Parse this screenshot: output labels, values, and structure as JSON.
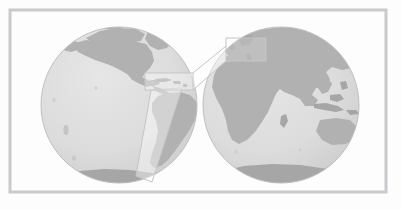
{
  "figure": {
    "background_color": "#fdfdfd",
    "frame": {
      "name": "outer-frame",
      "x": 10,
      "y": 10,
      "width": 376,
      "height": 182,
      "stroke_color": "#c9c9ce",
      "stroke_width": 3,
      "fill": "none"
    },
    "palette": {
      "ocean": "#dedede",
      "ocean_shade": "#d4d4d4",
      "land": "#b1b1b1",
      "land_dark": "#a6a6a6",
      "globe_outline": "#bfbfbf",
      "callout_stroke": "#c6c6c6",
      "callout_fill": "#ffffff",
      "connector_stroke": "#c6c6c6",
      "background": "#fdfdfd"
    },
    "globes": [
      {
        "name": "globe-americas",
        "label": "Western hemisphere globe showing the Americas",
        "center_x": 119,
        "center_y": 105,
        "radius": 78,
        "regions": [
          "North America",
          "Central America",
          "South America",
          "Greenland",
          "Antarctica"
        ]
      },
      {
        "name": "globe-eurasia-africa",
        "label": "Eastern hemisphere globe showing Europe, Africa, Asia and Australia",
        "center_x": 281,
        "center_y": 105,
        "radius": 78,
        "regions": [
          "Europe",
          "Africa",
          "Asia",
          "Australia",
          "Indonesia",
          "Antarctica"
        ]
      }
    ],
    "callouts": [
      {
        "name": "callout-rect-americas",
        "label": "Zoom rectangle over Central America and the Caribbean",
        "x": 145,
        "y": 73,
        "width": 48,
        "height": 17
      },
      {
        "name": "callout-rect-europe",
        "label": "Zoom rectangle over Europe",
        "x": 226,
        "y": 38,
        "width": 40,
        "height": 23
      }
    ],
    "connectors": [
      {
        "name": "connector-upper",
        "label": "Upper connector line from Americas callout to Europe callout",
        "points": "193,73 226,46"
      },
      {
        "name": "connector-lower",
        "label": "Lower connector line from Americas callout to Europe callout",
        "points": "193,90 226,61"
      }
    ],
    "pointer": {
      "name": "pointer-quadrilateral",
      "label": "Narrow tapering quadrilateral pointing to the south-west",
      "points": "151,90 182,88 152,182 136,176"
    },
    "caption": ""
  }
}
